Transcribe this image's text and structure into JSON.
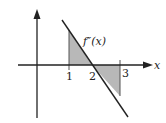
{
  "figure": {
    "function_label": "f″(x)",
    "x_axis_label": "x",
    "ticks": [
      {
        "label": "1",
        "value": 1
      },
      {
        "label": "2",
        "value": 2
      },
      {
        "label": "3",
        "value": 3
      }
    ],
    "shaded_regions": [
      {
        "from": 1,
        "to": 2,
        "side": "above"
      },
      {
        "from": 2,
        "to": 3,
        "side": "below"
      }
    ],
    "colors": {
      "axes": "#222222",
      "line": "#222222",
      "shade": "#b8b8b8"
    }
  }
}
